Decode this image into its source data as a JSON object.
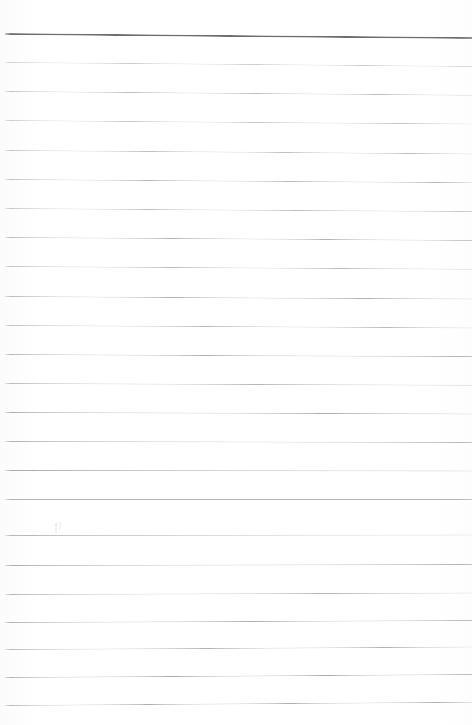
{
  "document": {
    "type": "scanned-ruled-notebook-page",
    "title": "Blank ruled notebook page",
    "page_width": 472,
    "page_height": 725,
    "background_color": "#ffffff",
    "content_text": "",
    "is_blank": true
  },
  "ruling": {
    "line_count": 24,
    "line_spacing_px": 29.2,
    "first_line_y": 33,
    "left_inset_px": 5,
    "right_inset_px": 0,
    "header_rule_color": "#6d6d6d",
    "header_rule_thickness_px": 1.8,
    "body_rule_color": "#b9b9b9",
    "body_rule_thickness_px": 1,
    "scan_skew_deg": 0.45,
    "lines": [
      {
        "index": 0,
        "y": 33,
        "color": "#6d6d6d",
        "thickness": 1.8,
        "opacity": 1.0,
        "skew": 0.5,
        "role": "header-rule"
      },
      {
        "index": 1,
        "y": 62,
        "color": "#c2c2c2",
        "thickness": 1.0,
        "opacity": 0.85,
        "skew": 0.48,
        "role": "body-rule"
      },
      {
        "index": 2,
        "y": 91,
        "color": "#b6b6b6",
        "thickness": 1.0,
        "opacity": 0.92,
        "skew": 0.46,
        "role": "body-rule"
      },
      {
        "index": 3,
        "y": 120,
        "color": "#bdbdbd",
        "thickness": 1.0,
        "opacity": 0.88,
        "skew": 0.44,
        "role": "body-rule"
      },
      {
        "index": 4,
        "y": 150,
        "color": "#b8b8b8",
        "thickness": 1.0,
        "opacity": 0.92,
        "skew": 0.42,
        "role": "body-rule"
      },
      {
        "index": 5,
        "y": 179,
        "color": "#b4b4b4",
        "thickness": 1.0,
        "opacity": 0.94,
        "skew": 0.4,
        "role": "body-rule"
      },
      {
        "index": 6,
        "y": 208,
        "color": "#b9b9b9",
        "thickness": 1.0,
        "opacity": 0.9,
        "skew": 0.38,
        "role": "body-rule"
      },
      {
        "index": 7,
        "y": 237,
        "color": "#b2b2b2",
        "thickness": 1.0,
        "opacity": 0.95,
        "skew": 0.36,
        "role": "body-rule"
      },
      {
        "index": 8,
        "y": 266,
        "color": "#b7b7b7",
        "thickness": 1.0,
        "opacity": 0.92,
        "skew": 0.34,
        "role": "body-rule"
      },
      {
        "index": 9,
        "y": 296,
        "color": "#b0b0b0",
        "thickness": 1.0,
        "opacity": 0.96,
        "skew": 0.32,
        "role": "body-rule"
      },
      {
        "index": 10,
        "y": 325,
        "color": "#b5b5b5",
        "thickness": 1.0,
        "opacity": 0.93,
        "skew": 0.3,
        "role": "body-rule"
      },
      {
        "index": 11,
        "y": 354,
        "color": "#aeaeae",
        "thickness": 1.0,
        "opacity": 0.97,
        "skew": 0.26,
        "role": "body-rule"
      },
      {
        "index": 12,
        "y": 383,
        "color": "#b3b3b3",
        "thickness": 1.0,
        "opacity": 0.94,
        "skew": 0.22,
        "role": "body-rule"
      },
      {
        "index": 13,
        "y": 412,
        "color": "#acacac",
        "thickness": 1.0,
        "opacity": 0.97,
        "skew": 0.18,
        "role": "body-rule"
      },
      {
        "index": 14,
        "y": 441,
        "color": "#b1b1b1",
        "thickness": 1.0,
        "opacity": 0.95,
        "skew": 0.12,
        "role": "body-rule"
      },
      {
        "index": 15,
        "y": 470,
        "color": "#aaaaaa",
        "thickness": 1.0,
        "opacity": 0.98,
        "skew": 0.06,
        "role": "body-rule"
      },
      {
        "index": 16,
        "y": 499,
        "color": "#b0b0b0",
        "thickness": 1.0,
        "opacity": 0.95,
        "skew": 0.0,
        "role": "body-rule"
      },
      {
        "index": 17,
        "y": 535,
        "color": "#b4b4b4",
        "thickness": 1.0,
        "opacity": 0.93,
        "skew": -0.06,
        "role": "body-rule"
      },
      {
        "index": 18,
        "y": 565,
        "color": "#adadad",
        "thickness": 1.0,
        "opacity": 0.97,
        "skew": -0.12,
        "role": "body-rule"
      },
      {
        "index": 19,
        "y": 594,
        "color": "#b2b2b2",
        "thickness": 1.0,
        "opacity": 0.94,
        "skew": -0.18,
        "role": "body-rule"
      },
      {
        "index": 20,
        "y": 622,
        "color": "#ababab",
        "thickness": 1.0,
        "opacity": 0.97,
        "skew": -0.24,
        "role": "body-rule"
      },
      {
        "index": 21,
        "y": 649,
        "color": "#b0b0b0",
        "thickness": 1.0,
        "opacity": 0.95,
        "skew": -0.3,
        "role": "body-rule"
      },
      {
        "index": 22,
        "y": 677,
        "color": "#a9a9a9",
        "thickness": 1.0,
        "opacity": 0.98,
        "skew": -0.36,
        "role": "body-rule"
      },
      {
        "index": 23,
        "y": 705,
        "color": "#aeaeae",
        "thickness": 1.0,
        "opacity": 0.96,
        "skew": -0.4,
        "role": "body-rule"
      }
    ]
  },
  "marks": [
    {
      "id": "faint-pencil-mark",
      "label": "faint pencil smudge",
      "x": 57,
      "y": 528,
      "width": 10,
      "height": 14,
      "color": "#9a9a9a",
      "opacity": 0.3
    }
  ]
}
